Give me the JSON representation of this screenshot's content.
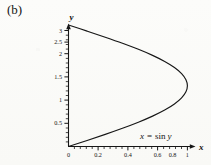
{
  "figure": {
    "panel_label": "(b)",
    "background_color": "#fbfbf9",
    "ink_color": "#161616"
  },
  "annotation": {
    "lhs": "x",
    "equals": "=",
    "rhs_func": "sin",
    "rhs_var": "y",
    "full": "x = sin y"
  },
  "axes": {
    "x_name": "x",
    "y_name": "y"
  },
  "chart_data": {
    "type": "line",
    "title": "(b)",
    "xlabel": "x",
    "ylabel": "y",
    "xlim": [
      0,
      1.08
    ],
    "ylim": [
      0,
      3.25
    ],
    "grid": false,
    "legend": null,
    "annotations": [
      {
        "text": "x = sin y",
        "x": 0.55,
        "y": 0.45
      }
    ],
    "xticks": [
      0,
      0.2,
      0.4,
      0.6,
      0.8,
      1
    ],
    "xticklabels": [
      "0",
      "0.2",
      "0.4",
      "0.6",
      "0.8",
      "1"
    ],
    "yticks": [
      0.5,
      1,
      1.5,
      2,
      2.5,
      3
    ],
    "yticklabels": [
      "0.5",
      "1",
      "1.5",
      "2",
      "2.5",
      "3"
    ],
    "series": [
      {
        "name": "x = sin y",
        "equation": "x = sin(y)",
        "parameter": "y",
        "parameter_range": [
          0,
          3.1416
        ],
        "color": "#161616",
        "linewidth": 1,
        "points": [
          {
            "y": 0.0,
            "x": 0.0
          },
          {
            "y": 0.1571,
            "x": 0.1564
          },
          {
            "y": 0.3142,
            "x": 0.309
          },
          {
            "y": 0.4712,
            "x": 0.454
          },
          {
            "y": 0.6283,
            "x": 0.5878
          },
          {
            "y": 0.7854,
            "x": 0.7071
          },
          {
            "y": 0.9425,
            "x": 0.809
          },
          {
            "y": 1.0996,
            "x": 0.891
          },
          {
            "y": 1.2566,
            "x": 0.9511
          },
          {
            "y": 1.4137,
            "x": 0.9877
          },
          {
            "y": 1.5708,
            "x": 1.0
          },
          {
            "y": 1.7279,
            "x": 0.9877
          },
          {
            "y": 1.885,
            "x": 0.9511
          },
          {
            "y": 2.042,
            "x": 0.891
          },
          {
            "y": 2.1991,
            "x": 0.809
          },
          {
            "y": 2.3562,
            "x": 0.7071
          },
          {
            "y": 2.5133,
            "x": 0.5878
          },
          {
            "y": 2.6704,
            "x": 0.454
          },
          {
            "y": 2.8274,
            "x": 0.309
          },
          {
            "y": 2.9845,
            "x": 0.1564
          },
          {
            "y": 3.1416,
            "x": 0.0
          }
        ]
      }
    ]
  }
}
